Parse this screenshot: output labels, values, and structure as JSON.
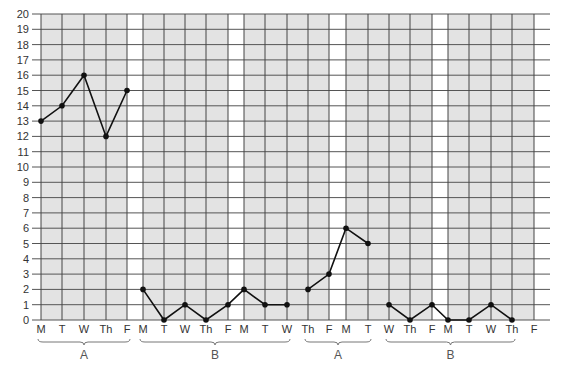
{
  "chart_data": {
    "type": "line",
    "title": "",
    "xlabel": "",
    "ylabel": "",
    "ylim": [
      0,
      20
    ],
    "yticks": [
      0,
      1,
      2,
      3,
      4,
      5,
      6,
      7,
      8,
      9,
      10,
      11,
      12,
      13,
      14,
      15,
      16,
      17,
      18,
      19,
      20
    ],
    "grid": true,
    "legend": "none",
    "x": [
      "M",
      "T",
      "W",
      "Th",
      "F",
      "M",
      "T",
      "W",
      "Th",
      "F",
      "M",
      "T",
      "W",
      "Th",
      "F",
      "M",
      "T",
      "W",
      "Th",
      "F",
      "M",
      "T",
      "W",
      "Th",
      "F",
      "M",
      "T",
      "W",
      "Th",
      "F"
    ],
    "columns": [
      {
        "label": "M",
        "x": 41,
        "shaded": true
      },
      {
        "label": "T",
        "x": 62,
        "shaded": true
      },
      {
        "label": "W",
        "x": 84,
        "shaded": true
      },
      {
        "label": "Th",
        "x": 106,
        "shaded": true
      },
      {
        "label": "F",
        "x": 127,
        "shaded": false
      },
      {
        "label": "M",
        "x": 143,
        "shaded": true
      },
      {
        "label": "T",
        "x": 164,
        "shaded": true
      },
      {
        "label": "W",
        "x": 185,
        "shaded": true
      },
      {
        "label": "Th",
        "x": 206,
        "shaded": true
      },
      {
        "label": "F",
        "x": 228,
        "shaded": false
      },
      {
        "label": "M",
        "x": 244,
        "shaded": true
      },
      {
        "label": "T",
        "x": 265,
        "shaded": true
      },
      {
        "label": "W",
        "x": 287,
        "shaded": true
      },
      {
        "label": "Th",
        "x": 308,
        "shaded": true
      },
      {
        "label": "F",
        "x": 329,
        "shaded": false
      },
      {
        "label": "M",
        "x": 346,
        "shaded": true
      },
      {
        "label": "T",
        "x": 368,
        "shaded": true
      },
      {
        "label": "W",
        "x": 389,
        "shaded": true
      },
      {
        "label": "Th",
        "x": 410,
        "shaded": true
      },
      {
        "label": "F",
        "x": 432,
        "shaded": false
      },
      {
        "label": "M",
        "x": 448,
        "shaded": true
      },
      {
        "label": "T",
        "x": 469,
        "shaded": true
      },
      {
        "label": "W",
        "x": 491,
        "shaded": true
      },
      {
        "label": "Th",
        "x": 512,
        "shaded": true
      },
      {
        "label": "F",
        "x": 534,
        "shaded": false
      }
    ],
    "series": [
      {
        "name": "Phase A1",
        "phase": "A",
        "points": [
          [
            0,
            13
          ],
          [
            1,
            14
          ],
          [
            2,
            16
          ],
          [
            3,
            12
          ],
          [
            4,
            15
          ]
        ]
      },
      {
        "name": "Phase B1",
        "phase": "B",
        "points": [
          [
            5,
            2
          ],
          [
            6,
            0
          ],
          [
            7,
            1
          ],
          [
            8,
            0
          ],
          [
            9,
            1
          ],
          [
            10,
            2
          ],
          [
            11,
            1
          ],
          [
            12,
            1
          ]
        ]
      },
      {
        "name": "Phase A2",
        "phase": "A",
        "points": [
          [
            13,
            2
          ],
          [
            14,
            3
          ],
          [
            15,
            6
          ],
          [
            16,
            5
          ]
        ]
      },
      {
        "name": "Phase B2",
        "phase": "B",
        "points": [
          [
            17,
            1
          ],
          [
            18,
            0
          ],
          [
            19,
            1
          ],
          [
            20,
            0
          ],
          [
            21,
            0
          ],
          [
            22,
            1
          ],
          [
            23,
            0
          ]
        ]
      }
    ],
    "phases": [
      {
        "label": "A",
        "from": 0,
        "to": 4
      },
      {
        "label": "B",
        "from": 5,
        "to": 12
      },
      {
        "label": "A",
        "from": 13,
        "to": 16
      },
      {
        "label": "B",
        "from": 17,
        "to": 23
      }
    ]
  }
}
